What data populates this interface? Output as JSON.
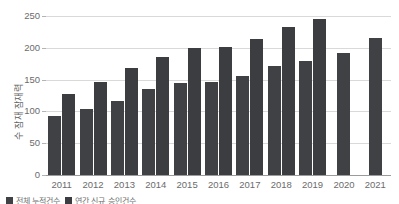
{
  "figure": {
    "top_clipped_text": "",
    "bottom_clipped_note": ""
  },
  "axis": {
    "y_title": "수 잠재 잠재력",
    "y_ticks": [
      "0",
      "50",
      "100",
      "150",
      "200",
      "250"
    ],
    "x_ticks": [
      "2011",
      "2012",
      "2013",
      "2014",
      "2015",
      "2016",
      "2017",
      "2018",
      "2019",
      "2020",
      "2021"
    ]
  },
  "legend": {
    "items": [
      {
        "label": "전체 누적건수",
        "color": "#3f4145"
      },
      {
        "label": "연간 신규 승인건수",
        "color": "#3b3d41"
      }
    ]
  },
  "chart_data": {
    "type": "bar",
    "title": "",
    "xlabel": "",
    "ylabel": "수 잠재 잠재력",
    "ylim": [
      0,
      250
    ],
    "grid": true,
    "legend_position": "bottom-left",
    "categories": [
      "2011",
      "2012",
      "2013",
      "2014",
      "2015",
      "2016",
      "2017",
      "2018",
      "2019",
      "2020",
      "2021"
    ],
    "series": [
      {
        "name": "Series 1",
        "color": "#3f4145",
        "values": [
          93,
          104,
          117,
          136,
          145,
          147,
          156,
          172,
          179,
          192,
          216
        ]
      },
      {
        "name": "Series 2",
        "color": "#3b3d41",
        "values": [
          127,
          147,
          168,
          185,
          199,
          201,
          214,
          233,
          246,
          null,
          null
        ]
      }
    ]
  }
}
